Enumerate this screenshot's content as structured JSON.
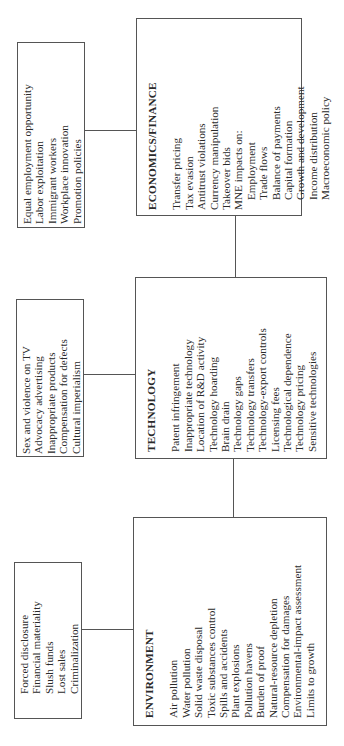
{
  "diagram": {
    "boxes": {
      "economics": {
        "title": "ECONOMICS/FINANCE",
        "items": [
          "Transfer pricing",
          "Tax evasion",
          "Antitrust violations",
          "Currency manipulation",
          "Takeover bids",
          "MNE impacts on:",
          "Employment",
          "Trade flows",
          "Balance of payments",
          "Capital formation",
          "Growth and development",
          "Income distribution",
          "Macroeconomic policy"
        ]
      },
      "economics_side": {
        "items": [
          "Equal employment opportunity",
          "Labor exploitation",
          "Immigrant workers",
          "Workplace innovation",
          "Promotion policies"
        ]
      },
      "technology": {
        "title": "TECHNOLOGY",
        "items": [
          "Patent infringement",
          "Inappropriate technology",
          "Location of R&D activity",
          "Technology hoarding",
          "Brain drain",
          "Technology gaps",
          "Technology transfers",
          "Technology-export controls",
          "Licensing fees",
          "Technological dependence",
          "Technology pricing",
          "Sensitive technologies"
        ]
      },
      "technology_side": {
        "items": [
          "Sex and violence on TV",
          "Advocacy advertising",
          "Inappropriate products",
          "Compensation for defects",
          "Cultural imperialism"
        ]
      },
      "environment": {
        "title": "ENVIRONMENT",
        "items": [
          "Air pollution",
          "Water pollution",
          "Solid waste disposal",
          "Toxic substances control",
          "Spills and accidents",
          "Plant explosions",
          "Pollution havens",
          "Burden of proof",
          "Natural-resource depletion",
          "Compensation for damages",
          "Environmental-impact assessment",
          "Limits to growth"
        ]
      },
      "environment_side": {
        "items": [
          "Forced disclosure",
          "Financial materiality",
          "Slush funds",
          "Lost sales",
          "Criminalization"
        ]
      }
    }
  }
}
